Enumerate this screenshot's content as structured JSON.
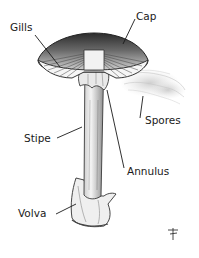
{
  "diagram": {
    "labels": [
      {
        "id": "gills",
        "text": "Gills"
      },
      {
        "id": "cap",
        "text": "Cap"
      },
      {
        "id": "spores",
        "text": "Spores"
      },
      {
        "id": "stipe",
        "text": "Stipe"
      },
      {
        "id": "annulus",
        "text": "Annulus"
      },
      {
        "id": "volva",
        "text": "Volva"
      }
    ],
    "signature": "artist-monogram",
    "colors": {
      "ink": "#1a1a1a",
      "shade": "#555555",
      "background": "#ffffff"
    }
  }
}
